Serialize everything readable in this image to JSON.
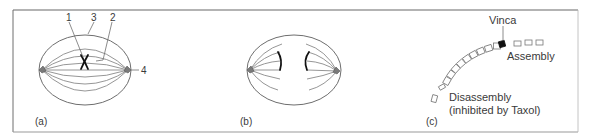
{
  "figure": {
    "panels": [
      {
        "id": "a",
        "caption": "(a)",
        "description": "metaphase spindle",
        "labels": [
          "1",
          "3",
          "2",
          "4"
        ]
      },
      {
        "id": "b",
        "caption": "(b)",
        "description": "anaphase spindle"
      },
      {
        "id": "c",
        "caption": "(c)",
        "description": "microtubule assembly/disassembly",
        "labels": {
          "vinca": "Vinca",
          "assembly": "Assembly",
          "disassembly": "Disassembly",
          "inhibited": "(inhibited by Taxol)"
        }
      }
    ],
    "colors": {
      "line": "#6e6e6e",
      "chromosome": "#111111",
      "vinca_subunit": "#111111"
    }
  }
}
